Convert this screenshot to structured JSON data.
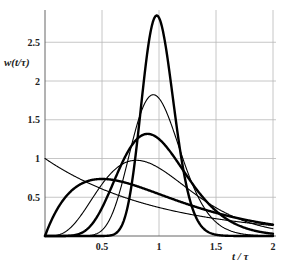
{
  "chart_data": {
    "type": "line",
    "title": "",
    "xlabel": "t / τ",
    "ylabel": "w(t/τ)",
    "xlim": [
      0,
      2
    ],
    "ylim": [
      0,
      2.9
    ],
    "x_ticks": [
      "0.5",
      "1",
      "1.5",
      "2"
    ],
    "x_tick_values": [
      0.5,
      1,
      1.5,
      2
    ],
    "y_ticks": [
      "0.5",
      "1",
      "1.5",
      "2",
      "2.5"
    ],
    "y_tick_values": [
      0.5,
      1,
      1.5,
      2,
      2.5
    ],
    "grid": true,
    "legend": "none",
    "model": "w(θ) = N (Nθ)^(N−1) e^(−Nθ) / (N−1)!",
    "series": [
      {
        "name": "N=1",
        "weight": "thin",
        "peak_x": 0.0,
        "peak_y": 1.0,
        "x": [
          0,
          0.25,
          0.5,
          0.75,
          1,
          1.25,
          1.5,
          1.75,
          2
        ],
        "values": [
          1.0,
          0.78,
          0.61,
          0.47,
          0.37,
          0.29,
          0.22,
          0.17,
          0.14
        ]
      },
      {
        "name": "N=2",
        "weight": "thick",
        "peak_x": 0.5,
        "peak_y": 0.74,
        "x": [
          0,
          0.25,
          0.5,
          0.75,
          1,
          1.25,
          1.5,
          1.75,
          2
        ],
        "values": [
          0,
          0.61,
          0.74,
          0.67,
          0.54,
          0.41,
          0.3,
          0.21,
          0.15
        ]
      },
      {
        "name": "N=5",
        "weight": "thin",
        "peak_x": 0.8,
        "peak_y": 0.98,
        "x": [
          0,
          0.25,
          0.5,
          0.75,
          1,
          1.25,
          1.5,
          1.75,
          2
        ],
        "values": [
          0,
          0.05,
          0.45,
          0.97,
          0.88,
          0.56,
          0.29,
          0.13,
          0.06
        ]
      },
      {
        "name": "N=10",
        "weight": "thick",
        "peak_x": 0.9,
        "peak_y": 1.32,
        "x": [
          0,
          0.25,
          0.5,
          0.75,
          1,
          1.25,
          1.5,
          1.75,
          2
        ],
        "values": [
          0,
          0.0,
          0.18,
          1.09,
          1.25,
          0.69,
          0.24,
          0.06,
          0.01
        ]
      },
      {
        "name": "N=20",
        "weight": "thin",
        "peak_x": 0.95,
        "peak_y": 1.81,
        "x": [
          0,
          0.25,
          0.5,
          0.75,
          1,
          1.25,
          1.5,
          1.75,
          2
        ],
        "values": [
          0,
          0.0,
          0.04,
          1.13,
          1.78,
          0.77,
          0.15,
          0.02,
          0.0
        ]
      },
      {
        "name": "N=50",
        "weight": "thick",
        "peak_x": 0.98,
        "peak_y": 2.84,
        "x": [
          0,
          0.25,
          0.5,
          0.75,
          1,
          1.25,
          1.5,
          1.75,
          2
        ],
        "values": [
          0,
          0.0,
          0.0,
          0.79,
          2.81,
          0.56,
          0.01,
          0.0,
          0.0
        ]
      }
    ]
  }
}
